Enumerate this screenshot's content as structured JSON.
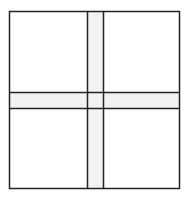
{
  "diagram": {
    "type": "grid-cross",
    "colors": {
      "background": "#ffffff",
      "band_fill": "#f2f2f2",
      "stroke": "#222222"
    },
    "outer_box": {
      "x": 9.5,
      "y": 11.5,
      "width": 170,
      "height": 177
    },
    "vertical_band": {
      "x": 87.5,
      "width": 16
    },
    "horizontal_band": {
      "y": 92.5,
      "height": 16
    },
    "quadrants": [
      "top-left",
      "top-right",
      "bottom-left",
      "bottom-right"
    ]
  }
}
